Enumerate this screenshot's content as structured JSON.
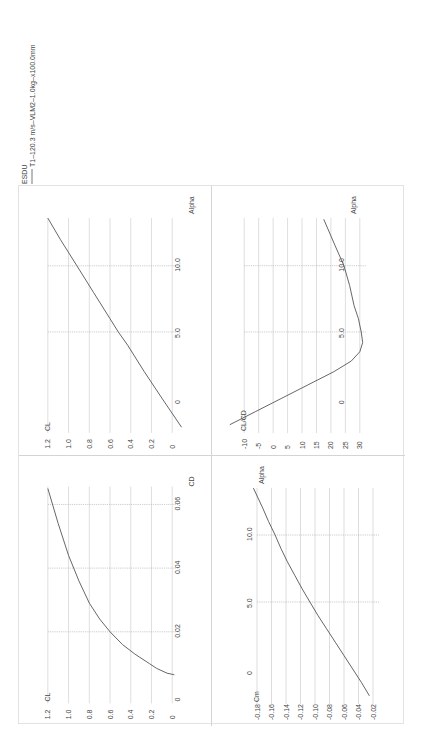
{
  "legend": {
    "header": "ESDU",
    "series_label": "T1–120.3 m/s–VLM2–1.0kg–x100.0mm",
    "line_color": "#555555"
  },
  "chart_data": [
    {
      "id": "cl-alpha",
      "type": "line",
      "title": "",
      "xlabel": "Alpha",
      "ylabel": "CL",
      "x_ticks": [
        "0",
        "5.0",
        "10.0"
      ],
      "x_tick_values": [
        0,
        5,
        10
      ],
      "y_ticks": [
        "0",
        "0.2",
        "0.4",
        "0.6",
        "0.8",
        "1.0",
        "1.2"
      ],
      "y_tick_values": [
        0,
        0.2,
        0.4,
        0.6,
        0.8,
        1.0,
        1.2
      ],
      "xlim": [
        -2.2,
        13.6
      ],
      "ylim": [
        0,
        1.2
      ],
      "grid": true,
      "series": [
        {
          "name": "T1–120.3 m/s–VLM2–1.0kg–x100.0mm",
          "x": [
            -2.2,
            0,
            2,
            4,
            5,
            6,
            8,
            10,
            12,
            13.6
          ],
          "y": [
            -0.09,
            0.1,
            0.27,
            0.43,
            0.52,
            0.6,
            0.76,
            0.92,
            1.08,
            1.2
          ]
        }
      ]
    },
    {
      "id": "cl-cd-alpha",
      "type": "line",
      "title": "",
      "xlabel": "Alpha",
      "ylabel": "CL/CD",
      "x_ticks": [
        "0",
        "5.0",
        "10.0"
      ],
      "x_tick_values": [
        0,
        5,
        10
      ],
      "y_ticks": [
        "-10",
        "-5",
        "0",
        "5",
        "10",
        "15",
        "20",
        "25",
        "30"
      ],
      "y_tick_values": [
        -10,
        -5,
        0,
        5,
        10,
        15,
        20,
        25,
        30
      ],
      "xlim": [
        -2.0,
        13.5
      ],
      "ylim": [
        -10,
        30
      ],
      "grid": true,
      "series": [
        {
          "name": "T1–120.3 m/s–VLM2–1.0kg–x100.0mm",
          "x": [
            -2.0,
            -1.0,
            0,
            1.0,
            2.0,
            2.8,
            3.5,
            4.2,
            5.0,
            6.0,
            7.0,
            8.5,
            10.0,
            11.5,
            13.5
          ],
          "y": [
            -15,
            -6,
            3,
            12,
            21,
            27,
            30,
            31,
            30.5,
            29.5,
            28,
            26.5,
            24.5,
            21.5,
            17.5
          ]
        }
      ]
    },
    {
      "id": "cl-cd",
      "type": "line",
      "title": "",
      "xlabel": "CD",
      "ylabel": "CL",
      "x_ticks": [
        "0",
        "0.02",
        "0.04",
        "0.06"
      ],
      "x_tick_values": [
        0,
        0.02,
        0.04,
        0.06
      ],
      "y_ticks": [
        "0",
        "0.2",
        "0.4",
        "0.6",
        "0.8",
        "1.0",
        "1.2"
      ],
      "y_tick_values": [
        0,
        0.2,
        0.4,
        0.6,
        0.8,
        1.0,
        1.2
      ],
      "xlim": [
        0,
        0.065
      ],
      "ylim": [
        0,
        1.2
      ],
      "grid": true,
      "series": [
        {
          "name": "T1–120.3 m/s–VLM2–1.0kg–x100.0mm",
          "x": [
            0.0065,
            0.007,
            0.0085,
            0.01,
            0.013,
            0.016,
            0.02,
            0.024,
            0.029,
            0.036,
            0.044,
            0.054,
            0.065
          ],
          "y": [
            -0.02,
            0.05,
            0.15,
            0.22,
            0.36,
            0.48,
            0.6,
            0.7,
            0.8,
            0.9,
            1.0,
            1.1,
            1.2
          ]
        }
      ]
    },
    {
      "id": "cm-alpha",
      "type": "line",
      "title": "",
      "xlabel": "Alpha",
      "ylabel": "Cm",
      "x_ticks": [
        "0",
        "5.0",
        "10.0"
      ],
      "x_tick_values": [
        0,
        5,
        10
      ],
      "y_ticks": [
        "-0.02",
        "-0.04",
        "-0.06",
        "-0.08",
        "-0.10",
        "-0.12",
        "-0.14",
        "-0.16",
        "-0.18"
      ],
      "y_tick_values": [
        -0.02,
        -0.04,
        -0.06,
        -0.08,
        -0.1,
        -0.12,
        -0.14,
        -0.16,
        -0.18
      ],
      "xlim": [
        -2.0,
        13.5
      ],
      "ylim": [
        -0.18,
        -0.02
      ],
      "grid": true,
      "series": [
        {
          "name": "T1–120.3 m/s–VLM2–1.0kg–x100.0mm",
          "x": [
            -2.0,
            -1.0,
            0,
            1.0,
            2.0,
            3.0,
            4.0,
            5.0,
            6.0,
            7.0,
            8.0,
            9.0,
            10.0,
            11.0,
            12.0,
            13.5
          ],
          "y": [
            -0.025,
            -0.036,
            -0.048,
            -0.06,
            -0.072,
            -0.084,
            -0.096,
            -0.107,
            -0.118,
            -0.128,
            -0.138,
            -0.147,
            -0.155,
            -0.164,
            -0.172,
            -0.185
          ]
        }
      ]
    }
  ]
}
